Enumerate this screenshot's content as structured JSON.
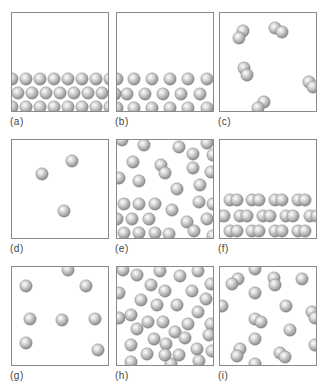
{
  "figure": {
    "sphere_radius": 6.2,
    "sphere_colors": {
      "highlight": "#ffffff",
      "mid": "#cfcfcf",
      "shadow": "#8c8c8c",
      "edge": "#7a7a7a"
    },
    "panels": [
      {
        "id": "a",
        "label": "(a)",
        "state": "solid-like packed monatomic",
        "x": 11,
        "y": 12,
        "atoms": [
          [
            0,
            66
          ],
          [
            14,
            66
          ],
          [
            28,
            66
          ],
          [
            42,
            66
          ],
          [
            56,
            66
          ],
          [
            70,
            66
          ],
          [
            84,
            66
          ],
          [
            98,
            66
          ],
          [
            6,
            80
          ],
          [
            20,
            80
          ],
          [
            34,
            80
          ],
          [
            48,
            80
          ],
          [
            62,
            80
          ],
          [
            76,
            80
          ],
          [
            90,
            80
          ],
          [
            0,
            94
          ],
          [
            14,
            94
          ],
          [
            28,
            94
          ],
          [
            42,
            94
          ],
          [
            56,
            94
          ],
          [
            70,
            94
          ],
          [
            84,
            94
          ],
          [
            98,
            94
          ]
        ]
      },
      {
        "id": "b",
        "label": "(b)",
        "state": "liquid-like monatomic layer",
        "x": 116,
        "y": 12,
        "atoms": [
          [
            0,
            66
          ],
          [
            17,
            66
          ],
          [
            35,
            66
          ],
          [
            53,
            66
          ],
          [
            71,
            66
          ],
          [
            90,
            66
          ],
          [
            -2,
            81
          ],
          [
            10,
            81
          ],
          [
            28,
            81
          ],
          [
            46,
            81
          ],
          [
            64,
            81
          ],
          [
            83,
            81
          ],
          [
            0,
            95
          ],
          [
            17,
            95
          ],
          [
            35,
            95
          ],
          [
            53,
            95
          ],
          [
            71,
            95
          ],
          [
            90,
            95
          ]
        ]
      },
      {
        "id": "c",
        "label": "(c)",
        "state": "gas of diatomic molecules",
        "x": 219,
        "y": 12,
        "molecules": [
          [
            [
              23,
              18
            ],
            [
              19,
              25
            ]
          ],
          [
            [
              55,
              15
            ],
            [
              62,
              19
            ]
          ],
          [
            [
              24,
              55
            ],
            [
              27,
              62
            ]
          ],
          [
            [
              89,
              69
            ],
            [
              93,
              74
            ]
          ],
          [
            [
              44,
              89
            ],
            [
              38,
              95
            ]
          ]
        ]
      },
      {
        "id": "d",
        "label": "(d)",
        "state": "dilute monatomic gas",
        "x": 11,
        "y": 139,
        "atoms": [
          [
            30,
            34
          ],
          [
            60,
            21
          ],
          [
            52,
            71
          ]
        ]
      },
      {
        "id": "e",
        "label": "(e)",
        "state": "mixed gas above liquid monatomic",
        "x": 116,
        "y": 139,
        "atoms": [
          [
            5,
            0
          ],
          [
            27,
            5
          ],
          [
            62,
            7
          ],
          [
            76,
            14
          ],
          [
            90,
            3
          ],
          [
            96,
            15
          ],
          [
            16,
            22
          ],
          [
            44,
            25
          ],
          [
            76,
            28
          ],
          [
            2,
            38
          ],
          [
            22,
            41
          ],
          [
            48,
            33
          ],
          [
            94,
            32
          ],
          [
            83,
            45
          ],
          [
            60,
            49
          ],
          [
            7,
            64
          ],
          [
            22,
            64
          ],
          [
            38,
            64
          ],
          [
            55,
            70
          ],
          [
            82,
            62
          ],
          [
            96,
            64
          ],
          [
            0,
            79
          ],
          [
            15,
            79
          ],
          [
            32,
            79
          ],
          [
            70,
            82
          ],
          [
            90,
            79
          ],
          [
            52,
            94
          ],
          [
            7,
            93
          ],
          [
            22,
            93
          ],
          [
            38,
            93
          ],
          [
            77,
            91
          ],
          [
            96,
            96
          ]
        ]
      },
      {
        "id": "f",
        "label": "(f)",
        "state": "solid-like packed diatomic",
        "x": 219,
        "y": 139,
        "molecules": [
          [
            [
              10,
              60
            ],
            [
              17,
              60
            ]
          ],
          [
            [
              32,
              60
            ],
            [
              39,
              60
            ]
          ],
          [
            [
              55,
              60
            ],
            [
              62,
              60
            ]
          ],
          [
            [
              78,
              60
            ],
            [
              85,
              60
            ]
          ],
          [
            [
              -2,
              76
            ],
            [
              4,
              76
            ]
          ],
          [
            [
              20,
              76
            ],
            [
              27,
              76
            ]
          ],
          [
            [
              43,
              76
            ],
            [
              50,
              76
            ]
          ],
          [
            [
              66,
              76
            ],
            [
              73,
              76
            ]
          ],
          [
            [
              90,
              76
            ],
            [
              97,
              76
            ]
          ],
          [
            [
              10,
              91
            ],
            [
              17,
              91
            ]
          ],
          [
            [
              32,
              91
            ],
            [
              39,
              91
            ]
          ],
          [
            [
              55,
              91
            ],
            [
              62,
              91
            ]
          ],
          [
            [
              78,
              91
            ],
            [
              85,
              91
            ]
          ]
        ]
      },
      {
        "id": "g",
        "label": "(g)",
        "state": "dilute monatomic gas",
        "x": 11,
        "y": 266,
        "atoms": [
          [
            56,
            3
          ],
          [
            14,
            19
          ],
          [
            74,
            19
          ],
          [
            18,
            52
          ],
          [
            50,
            53
          ],
          [
            83,
            52
          ],
          [
            14,
            76
          ],
          [
            86,
            83
          ]
        ]
      },
      {
        "id": "h",
        "label": "(h)",
        "state": "dense monatomic fluid",
        "x": 116,
        "y": 266,
        "atoms": [
          [
            6,
            3
          ],
          [
            20,
            8
          ],
          [
            43,
            4
          ],
          [
            63,
            9
          ],
          [
            81,
            4
          ],
          [
            94,
            17
          ],
          [
            2,
            26
          ],
          [
            34,
            18
          ],
          [
            48,
            24
          ],
          [
            75,
            24
          ],
          [
            24,
            33
          ],
          [
            40,
            38
          ],
          [
            60,
            38
          ],
          [
            89,
            32
          ],
          [
            14,
            48
          ],
          [
            2,
            51
          ],
          [
            31,
            55
          ],
          [
            81,
            45
          ],
          [
            46,
            55
          ],
          [
            58,
            65
          ],
          [
            71,
            57
          ],
          [
            94,
            57
          ],
          [
            20,
            62
          ],
          [
            37,
            72
          ],
          [
            68,
            71
          ],
          [
            92,
            68
          ],
          [
            49,
            77
          ],
          [
            14,
            78
          ],
          [
            80,
            82
          ],
          [
            95,
            84
          ],
          [
            30,
            87
          ],
          [
            54,
            97
          ],
          [
            62,
            88
          ],
          [
            14,
            95
          ],
          [
            82,
            94
          ],
          [
            48,
            88
          ]
        ]
      },
      {
        "id": "i",
        "label": "(i)",
        "state": "gas of mixed monatomic and diatomic",
        "x": 219,
        "y": 266,
        "atoms": [
          [
            35,
            2
          ],
          [
            82,
            12
          ],
          [
            35,
            26
          ],
          [
            2,
            39
          ],
          [
            66,
            39
          ],
          [
            70,
            63
          ],
          [
            95,
            78
          ],
          [
            35,
            72
          ],
          [
            35,
            97
          ]
        ],
        "molecules": [
          [
            [
              18,
              12
            ],
            [
              12,
              17
            ]
          ],
          [
            [
              54,
              11
            ],
            [
              55,
              18
            ]
          ],
          [
            [
              92,
              45
            ],
            [
              95,
              51
            ]
          ],
          [
            [
              35,
              52
            ],
            [
              41,
              55
            ]
          ],
          [
            [
              20,
              82
            ],
            [
              17,
              89
            ]
          ],
          [
            [
              60,
              86
            ],
            [
              65,
              90
            ]
          ]
        ]
      }
    ]
  }
}
